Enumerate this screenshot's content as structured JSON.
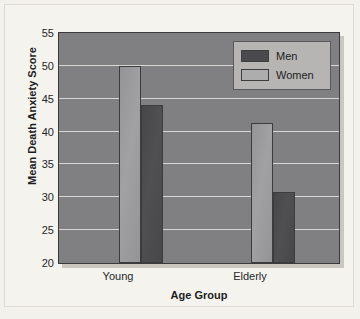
{
  "chart_data": {
    "type": "bar",
    "title": "",
    "xlabel": "Age Group",
    "ylabel": "Mean Death Anxiety Score",
    "categories": [
      "Young",
      "Elderly"
    ],
    "series": [
      {
        "name": "Men",
        "values": [
          44.1,
          30.8
        ],
        "color": "#4a4a4d"
      },
      {
        "name": "Women",
        "values": [
          50.0,
          41.3
        ],
        "color": "#9a9a9c"
      }
    ],
    "ylim": [
      20,
      55
    ],
    "ytick_step": 5,
    "yticks": [
      "55",
      "50",
      "45",
      "40",
      "35",
      "30",
      "25",
      "20"
    ],
    "grid": true,
    "grid_color": "#d8d7d3",
    "legend_position": "top-right",
    "plot_background": "#808083",
    "page_background": "#f4f3ee"
  },
  "legend": {
    "items": [
      {
        "label": "Men"
      },
      {
        "label": "Women"
      }
    ]
  }
}
